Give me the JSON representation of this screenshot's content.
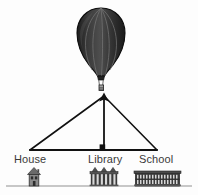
{
  "diagram": {
    "background_color": "#fdfdfd",
    "line_color": "#111111",
    "ground_color": "#b0b0b0",
    "label_color": "#3a3a3a"
  },
  "balloon": {
    "name": "hot-air-balloon",
    "envelope_color": "#2b2b2b",
    "envelope_shade_color": "#4a4a4a",
    "seam_color": "#6a6a6a",
    "outline_color": "#101010",
    "basket_color": "#8c8c8c",
    "basket_outline_color": "#2a2a2a",
    "gore_count": 5,
    "position": {
      "cx": 101,
      "cy": 42
    }
  },
  "triangle": {
    "name": "sight-line-triangle",
    "apex": {
      "x": 104,
      "y": 96
    },
    "left_vertex": {
      "x": 30,
      "y": 150
    },
    "right_vertex": {
      "x": 157,
      "y": 150
    },
    "altitude_foot": {
      "x": 104,
      "y": 150
    },
    "stroke_color": "#111111",
    "stroke_width": 1.6,
    "right_angle_marker": true,
    "arrowhead_at_apex": true
  },
  "ground": {
    "name": "ground-line",
    "y": 186,
    "x_start": 6,
    "x_end": 192,
    "color": "#b5b5b5"
  },
  "places": [
    {
      "id": "house",
      "label": "House",
      "icon": "house-icon",
      "x": 34,
      "building_color": "#6e6e6e",
      "building_dark": "#3c3c3c"
    },
    {
      "id": "library",
      "label": "Library",
      "icon": "library-icon",
      "x": 104,
      "building_color": "#6e6e6e",
      "building_dark": "#3c3c3c"
    },
    {
      "id": "school",
      "label": "School",
      "icon": "school-icon",
      "x": 157,
      "building_color": "#6e6e6e",
      "building_dark": "#3c3c3c"
    }
  ]
}
